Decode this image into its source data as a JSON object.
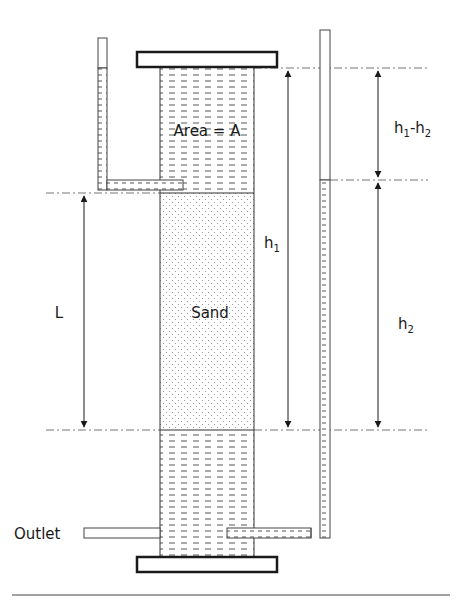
{
  "diagram": {
    "labels": {
      "area": "Area = A",
      "sand": "Sand",
      "L": "L",
      "h1_base": "h",
      "h1_sub": "1",
      "h2_base": "h",
      "h2_sub": "2",
      "diff_h1_base": "h",
      "diff_h1_sub": "1",
      "diff_minus": "-h",
      "diff_h2_sub": "2",
      "outlet": "Outlet"
    },
    "components": [
      "top-cap",
      "column",
      "water-upper",
      "sand-sample",
      "water-lower",
      "bottom-cap",
      "left-piezometer",
      "right-piezometer",
      "outlet-pipe"
    ],
    "dimensions": [
      {
        "name": "L",
        "meaning": "length of sand sample"
      },
      {
        "name": "h1",
        "meaning": "head from top water level to bottom datum"
      },
      {
        "name": "h2",
        "meaning": "head from right piezometer level to bottom datum"
      },
      {
        "name": "h1-h2",
        "meaning": "head difference"
      }
    ],
    "colors": {
      "stroke": "#1a1a1a",
      "water_dash": "#555555",
      "sand_dot": "#8a8a8a",
      "guide": "#777777",
      "background": "#ffffff"
    }
  }
}
